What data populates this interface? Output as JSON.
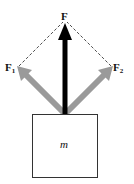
{
  "diagram": {
    "type": "force-vector-diagram",
    "labels": {
      "resultant": "F",
      "force1_main": "F",
      "force1_sub": "1",
      "force2_main": "F",
      "force2_sub": "2",
      "mass": "m"
    },
    "colors": {
      "resultant_arrow": "#000000",
      "component_arrows": "#9a9a9a",
      "dashed_lines": "#222222",
      "box_stroke": "#333333",
      "background": "#ffffff"
    },
    "vectors": [
      {
        "name": "F",
        "from": [
          65,
          114
        ],
        "to": [
          65,
          24
        ],
        "color": "black"
      },
      {
        "name": "F1",
        "from": [
          65,
          114
        ],
        "to": [
          18,
          67
        ],
        "color": "gray"
      },
      {
        "name": "F2",
        "from": [
          65,
          114
        ],
        "to": [
          112,
          67
        ],
        "color": "gray"
      }
    ],
    "box": {
      "x": 32,
      "y": 114,
      "width": 66,
      "height": 64
    }
  }
}
